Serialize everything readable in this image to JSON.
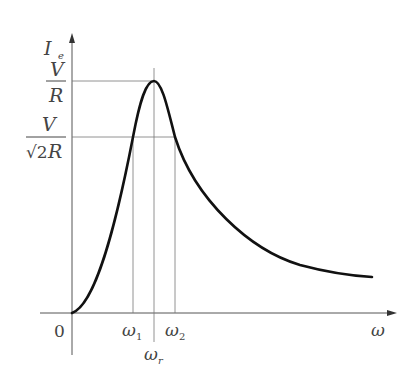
{
  "diagram": {
    "y_axis_label": "I",
    "y_axis_subscript": "e",
    "x_axis_label": "ω",
    "origin_label": "0",
    "peak_label": {
      "numerator": "V",
      "denominator": "R"
    },
    "half_power_label": {
      "numerator": "V",
      "sqrt": "√2",
      "denominator_suffix": "R"
    },
    "x_ticks": [
      {
        "label": "ω",
        "subscript": "1"
      },
      {
        "label": "ω",
        "subscript": "2"
      },
      {
        "label": "ω",
        "subscript": "r"
      }
    ],
    "colors": {
      "curve": "#111111",
      "axis": "#555555",
      "guide": "#777777",
      "text": "#444444"
    }
  }
}
